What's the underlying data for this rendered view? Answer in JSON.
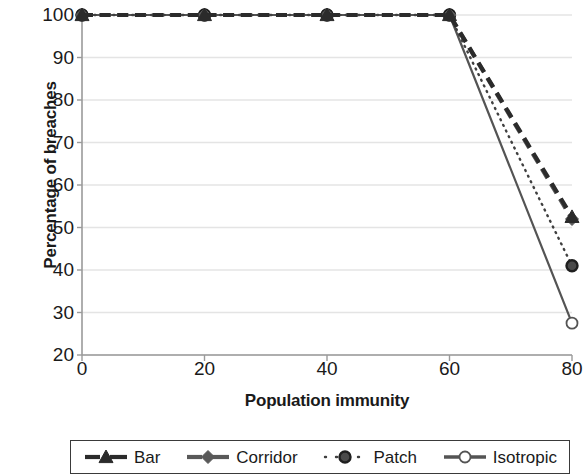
{
  "chart_data": {
    "type": "line",
    "title": "",
    "xlabel": "Population immunity",
    "ylabel": "Percentage of breaches",
    "x": [
      0,
      20,
      40,
      60,
      80
    ],
    "xlim": [
      0,
      80
    ],
    "ylim": [
      20,
      100
    ],
    "xticks": [
      "0",
      "20",
      "40",
      "60",
      "80"
    ],
    "yticks": [
      "20",
      "30",
      "40",
      "50",
      "60",
      "70",
      "80",
      "90",
      "100"
    ],
    "grid": "horizontal",
    "legend_position": "bottom",
    "series": [
      {
        "name": "Bar",
        "values": [
          100,
          100,
          100,
          100,
          52.5
        ],
        "color": "#2b2b2b",
        "marker": "triangle",
        "dash": "dashed"
      },
      {
        "name": "Corridor",
        "values": [
          100,
          100,
          100,
          100,
          52.0
        ],
        "color": "#595959",
        "marker": "diamond",
        "dash": "dashed"
      },
      {
        "name": "Patch",
        "values": [
          100,
          100,
          100,
          100,
          41.0
        ],
        "color": "#404040",
        "marker": "circle",
        "dash": "dotted"
      },
      {
        "name": "Isotropic",
        "values": [
          100,
          100,
          100,
          100,
          27.5
        ],
        "color": "#545454",
        "marker": "circle-open",
        "dash": "solid"
      }
    ]
  },
  "legend": {
    "items": [
      {
        "label": "Bar",
        "icon": "triangle-marker-dashed-line-icon"
      },
      {
        "label": "Corridor",
        "icon": "diamond-marker-dashed-line-icon"
      },
      {
        "label": "Patch",
        "icon": "circle-marker-dotted-line-icon"
      },
      {
        "label": "Isotropic",
        "icon": "open-circle-marker-solid-line-icon"
      }
    ]
  },
  "colors": {
    "gridline": "#e4e4e4",
    "axis": "#9a9a9a",
    "text": "#1a1a1a",
    "legend_border": "#3a3a3a"
  }
}
